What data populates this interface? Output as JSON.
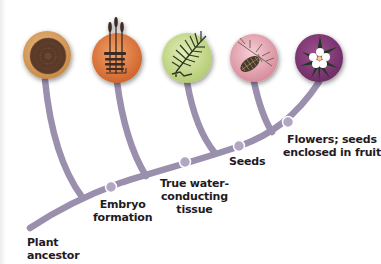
{
  "colors": {
    "branch": "#9b8fae",
    "node": "#b3a6c4",
    "node_ring": "#ffffff",
    "label_text": "#1f1a24",
    "circle_liverwort": "#d9a25c",
    "circle_moss": "#e07a3c",
    "circle_fern": "#c8dc8c",
    "circle_conifer": "#e8a7b4",
    "circle_flower": "#8a3d7e"
  },
  "groups": [
    {
      "name": "liverworts",
      "icon": "liverwort-icon"
    },
    {
      "name": "mosses",
      "icon": "moss-icon"
    },
    {
      "name": "ferns",
      "icon": "fern-icon"
    },
    {
      "name": "conifers",
      "icon": "pinecone-icon"
    },
    {
      "name": "flowering plants",
      "icon": "flower-icon"
    }
  ],
  "labels": {
    "root": [
      "Plant",
      "ancestor"
    ],
    "node1": [
      "Embryo",
      "formation"
    ],
    "node2": [
      "True water-",
      "conducting",
      "tissue"
    ],
    "node3": [
      "Seeds"
    ],
    "node4": [
      "Flowers; seeds",
      "enclosed in fruit"
    ]
  }
}
